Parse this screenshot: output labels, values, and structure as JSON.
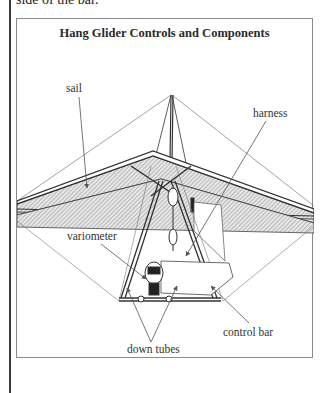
{
  "page": {
    "preceding_text": "side of the bar."
  },
  "figure": {
    "title": "Hang Glider Controls and Components",
    "labels": {
      "sail": "sail",
      "harness": "harness",
      "variometer": "variometer",
      "control_bar": "control bar",
      "down_tubes": "down tubes"
    }
  }
}
